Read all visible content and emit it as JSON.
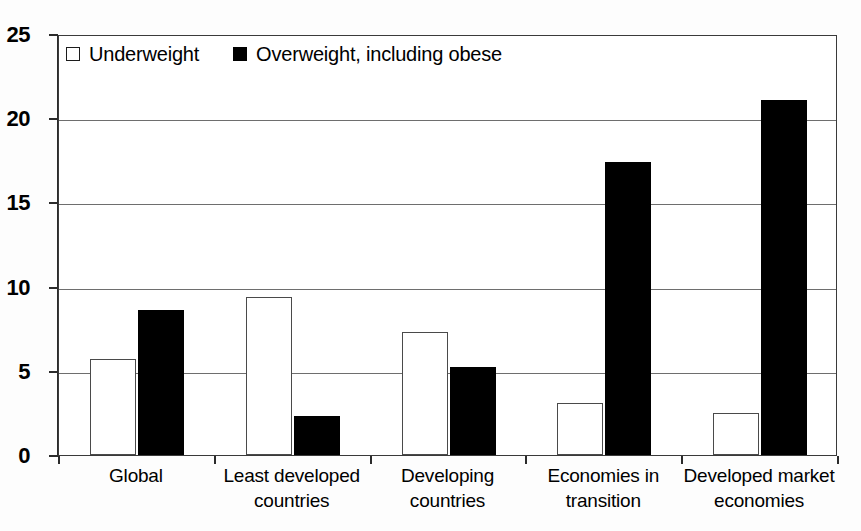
{
  "chart_data": {
    "type": "bar",
    "title": "",
    "subtitle": "",
    "xlabel": "",
    "ylabel": "",
    "ylim": [
      0,
      25
    ],
    "yticks": [
      0,
      5,
      10,
      15,
      20,
      25
    ],
    "ytick_labels": [
      "0",
      "5",
      "10",
      "15",
      "20",
      "25"
    ],
    "grid": "horizontal",
    "legend_position": "top-left-inside",
    "categories": [
      "Global",
      "Least developed\ncountries",
      "Developing\ncountries",
      "Economies in\ntransition",
      "Developed market\neconomies"
    ],
    "series": [
      {
        "name": "Underweight",
        "color": "#ffffff",
        "edge_color": "#4a4a4a",
        "marker_style": "hollow-square",
        "values": [
          5.7,
          9.4,
          7.3,
          3.1,
          2.5
        ]
      },
      {
        "name": "Overweight, including obese",
        "color": "#000000",
        "edge_color": "#000000",
        "marker_style": "solid-square",
        "values": [
          8.6,
          2.3,
          5.2,
          17.4,
          21.1
        ]
      }
    ]
  },
  "legend": {
    "items": [
      {
        "label": "Underweight",
        "swatch": "hollow-square"
      },
      {
        "label": "Overweight, including obese",
        "swatch": "solid-square"
      }
    ]
  }
}
